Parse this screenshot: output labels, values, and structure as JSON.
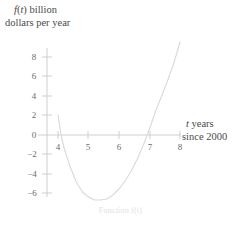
{
  "axes": {
    "y_axis_label_line1": "f(t) billion",
    "y_axis_label_line2": "dollars per year",
    "x_axis_label_line1": "t years",
    "x_axis_label_line2": "since 2000"
  },
  "caption": "Function f(t)",
  "colors": {
    "curve": "#d9d9d9",
    "axis": "#c9c9c9",
    "tick_label": "#6b6b6b",
    "label_text": "#4a4a4a",
    "caption": "#e2e2e2",
    "background": "#ffffff"
  },
  "chart_data": {
    "type": "line",
    "title": "",
    "subtitle": "",
    "xlabel": "t years since 2000",
    "ylabel": "f(t) billion dollars per year",
    "xlim": [
      3.6,
      8.2
    ],
    "ylim": [
      -7.4,
      9.6
    ],
    "xticks": [
      4,
      5,
      6,
      7,
      8
    ],
    "yticks": [
      8,
      6,
      4,
      2,
      0,
      -2,
      -4,
      -6
    ],
    "ytick_labels": [
      "8",
      "6",
      "4",
      "2",
      "0",
      "−2",
      "−4",
      "−6"
    ],
    "xtick_labels": [
      "4",
      "5",
      "6",
      "7",
      "8"
    ],
    "grid": false,
    "legend": "none",
    "series": [
      {
        "name": "f(t)",
        "x": [
          4.0,
          4.1,
          4.2,
          4.4,
          4.6,
          4.8,
          5.0,
          5.2,
          5.4,
          5.6,
          5.8,
          6.0,
          6.2,
          6.4,
          6.6,
          6.8,
          7.0,
          7.2,
          7.4,
          7.6,
          7.8,
          8.0
        ],
        "y": [
          2.0,
          0.0,
          -1.3,
          -3.2,
          -4.7,
          -5.7,
          -6.2,
          -6.5,
          -6.5,
          -6.4,
          -6.0,
          -5.4,
          -4.6,
          -3.6,
          -2.4,
          -1.0,
          0.6,
          2.4,
          3.9,
          5.5,
          7.2,
          9.3
        ]
      }
    ],
    "annotations": {
      "roots": [
        4.1,
        7.15
      ],
      "vertex": [
        5.5,
        -6.5
      ]
    }
  }
}
